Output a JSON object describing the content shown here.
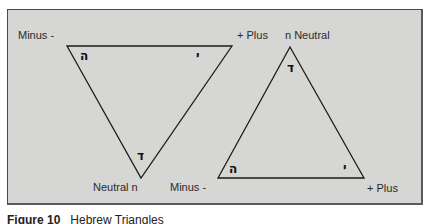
{
  "figure": {
    "caption_label": "Figure 10",
    "caption_text": "Hebrew Triangles"
  },
  "left_triangle": {
    "orientation": "inverted",
    "vertices": {
      "top_left": {
        "x": 67,
        "y": 46
      },
      "top_right": {
        "x": 232,
        "y": 46
      },
      "bottom": {
        "x": 141,
        "y": 178
      }
    },
    "labels": {
      "top_left": "Minus -",
      "top_right": "+ Plus",
      "bottom": "Neutral n"
    },
    "glyphs": {
      "top_left": "ה",
      "top_right": "י",
      "bottom": "ד"
    }
  },
  "right_triangle": {
    "orientation": "upright",
    "vertices": {
      "top": {
        "x": 290,
        "y": 47
      },
      "bottom_left": {
        "x": 218,
        "y": 178
      },
      "bottom_right": {
        "x": 364,
        "y": 178
      }
    },
    "labels": {
      "top": "n Neutral",
      "bottom_left": "Minus -",
      "bottom_right": "+ Plus"
    },
    "glyphs": {
      "top": "ד",
      "bottom_left": "ה",
      "bottom_right": "י"
    }
  },
  "colors": {
    "background": "#d6d6d4",
    "line": "#1a1a1a",
    "text": "#2a2a2a"
  }
}
